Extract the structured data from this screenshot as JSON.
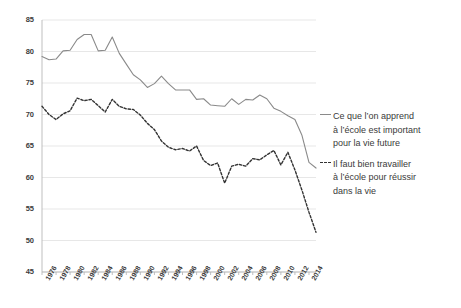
{
  "chart_data": {
    "type": "line",
    "title": "",
    "xlabel": "",
    "ylabel": "",
    "ylim": [
      45,
      85
    ],
    "ytick_step": 5,
    "yticks": [
      85,
      80,
      75,
      70,
      65,
      60,
      55,
      50,
      45
    ],
    "grid": true,
    "legend_position": "right",
    "x_tick_labels": [
      "1976",
      "1978",
      "1980",
      "1982",
      "1984",
      "1986",
      "1988",
      "1990",
      "1992",
      "1994",
      "1996",
      "1998",
      "2000",
      "2002",
      "2004",
      "2006",
      "2008",
      "2010",
      "2012",
      "2014"
    ],
    "x": [
      1976,
      1977,
      1978,
      1979,
      1980,
      1981,
      1982,
      1983,
      1984,
      1985,
      1986,
      1987,
      1988,
      1989,
      1990,
      1991,
      1992,
      1993,
      1994,
      1995,
      1996,
      1997,
      1998,
      1999,
      2000,
      2001,
      2002,
      2003,
      2004,
      2005,
      2006,
      2007,
      2008,
      2009,
      2010,
      2011,
      2012,
      2013,
      2014,
      2015
    ],
    "series": [
      {
        "name": "Ce que l'on apprend à l'école est important pour la vie future",
        "style": "solid",
        "color": "#8a8a8a",
        "values": [
          79.2,
          78.7,
          78.8,
          80.1,
          80.2,
          81.9,
          82.7,
          82.7,
          80.1,
          80.2,
          82.3,
          79.7,
          78.0,
          76.3,
          75.5,
          74.3,
          74.9,
          76.1,
          74.9,
          73.9,
          73.9,
          73.9,
          72.4,
          72.5,
          71.5,
          71.4,
          71.3,
          72.5,
          71.6,
          72.4,
          72.3,
          73.1,
          72.5,
          71.0,
          70.5,
          69.8,
          69.2,
          66.7,
          62.4,
          61.5
        ]
      },
      {
        "name": "Il faut bien travailler à l'école pour réussir dans la vie",
        "style": "dashed",
        "color": "#333333",
        "values": [
          71.3,
          70.0,
          69.2,
          70.1,
          70.6,
          72.6,
          72.2,
          72.4,
          71.4,
          70.4,
          72.4,
          71.3,
          70.9,
          70.8,
          69.9,
          68.6,
          67.6,
          65.8,
          64.8,
          64.4,
          64.6,
          64.2,
          65.0,
          62.7,
          61.9,
          62.3,
          59.1,
          61.8,
          62.1,
          61.8,
          63.0,
          62.8,
          63.6,
          64.3,
          62.0,
          64.0,
          61.2,
          58.0,
          54.5,
          51.3
        ]
      }
    ]
  },
  "legend": {
    "entries": [
      {
        "line1": "Ce que l’on apprend",
        "line2": "à l’école est important",
        "line3": "pour la vie future",
        "marker": "solid-line-marker"
      },
      {
        "line1": "Il faut bien travailler",
        "line2": "à l’école pour réussir",
        "line3": "dans la vie",
        "marker": "dashed-line-marker"
      }
    ]
  }
}
